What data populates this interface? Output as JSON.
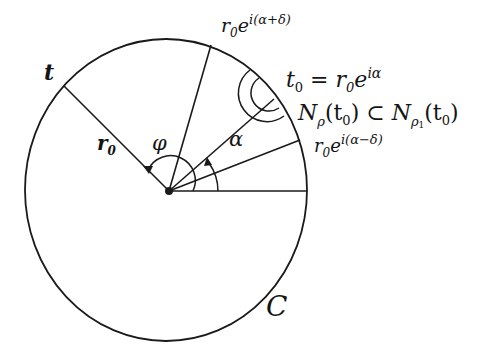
{
  "diagram": {
    "colors": {
      "stroke": "#1a1a1a",
      "background": "#ffffff"
    },
    "center": {
      "x": 169,
      "y": 191
    },
    "circle": {
      "rx": 140,
      "ry": 150,
      "label": "C"
    },
    "rays": [
      {
        "name": "ray-t",
        "x2": 64,
        "y2": 86
      },
      {
        "name": "ray-alpha-plus-delta",
        "x2": 210,
        "y2": 46
      },
      {
        "name": "ray-t0",
        "x2": 273,
        "y2": 100
      },
      {
        "name": "ray-alpha-minus-delta",
        "x2": 300,
        "y2": 140
      },
      {
        "name": "ray-horizontal",
        "x2": 308,
        "y2": 191
      }
    ],
    "labels": {
      "t": "t",
      "r0": "r",
      "r0_sub": "0",
      "phi": "φ",
      "alpha": "α",
      "C": "C",
      "upper_point": {
        "base": "r",
        "sub": "0",
        "e": "e",
        "exp": "i(α+δ)"
      },
      "t0_eq": {
        "t": "t",
        "t_sub": "0",
        "eq": " = r",
        "r_sub": "0",
        "e": "e",
        "exp": "iα"
      },
      "nbhd": {
        "N1": "N",
        "sub1": "ρ",
        "arg1": "(t",
        "arg1_sub": "0",
        "arg1_close": ")",
        "subset": " ⊂ ",
        "N2": "N",
        "sub2": "ρ",
        "sub2_sub": "1",
        "arg2": "(t",
        "arg2_sub": "0",
        "arg2_close": ")"
      },
      "lower_point": {
        "base": "r",
        "sub": "0",
        "e": "e",
        "exp": "i(α−δ)"
      }
    }
  }
}
